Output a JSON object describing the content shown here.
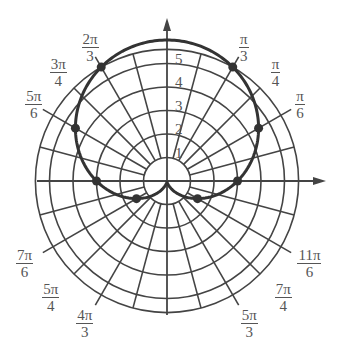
{
  "chart_data": {
    "type": "polar",
    "equation": "r = 3 + 3 sin θ",
    "curve": "cardioid",
    "radial_tick_labels": [
      "1",
      "2",
      "3",
      "4",
      "5"
    ],
    "grid_circles": [
      1,
      2,
      3,
      4,
      5,
      5.6
    ],
    "angle_labels": [
      {
        "num": "π",
        "den": "6",
        "theta": "π/6"
      },
      {
        "num": "π",
        "den": "4",
        "theta": "π/4"
      },
      {
        "num": "π",
        "den": "3",
        "theta": "π/3"
      },
      {
        "num": "2π",
        "den": "3",
        "theta": "2π/3"
      },
      {
        "num": "3π",
        "den": "4",
        "theta": "3π/4"
      },
      {
        "num": "5π",
        "den": "6",
        "theta": "5π/6"
      },
      {
        "num": "7π",
        "den": "6",
        "theta": "7π/6"
      },
      {
        "num": "5π",
        "den": "4",
        "theta": "5π/4"
      },
      {
        "num": "4π",
        "den": "3",
        "theta": "4π/3"
      },
      {
        "num": "5π",
        "den": "3",
        "theta": "5π/3"
      },
      {
        "num": "7π",
        "den": "4",
        "theta": "7π/4"
      },
      {
        "num": "11π",
        "den": "6",
        "theta": "11π/6"
      }
    ],
    "points": [
      {
        "theta": "0",
        "r": 3
      },
      {
        "theta": "π/6",
        "r": 4.5
      },
      {
        "theta": "π/3",
        "r": 5.6
      },
      {
        "theta": "2π/3",
        "r": 5.6
      },
      {
        "theta": "5π/6",
        "r": 4.5
      },
      {
        "theta": "π",
        "r": 3
      },
      {
        "theta": "7π/6",
        "r": 1.5
      },
      {
        "theta": "11π/6",
        "r": 1.5
      }
    ],
    "colors": {
      "curve": "#333333",
      "grid": "#444444",
      "labels": "#555555"
    }
  }
}
